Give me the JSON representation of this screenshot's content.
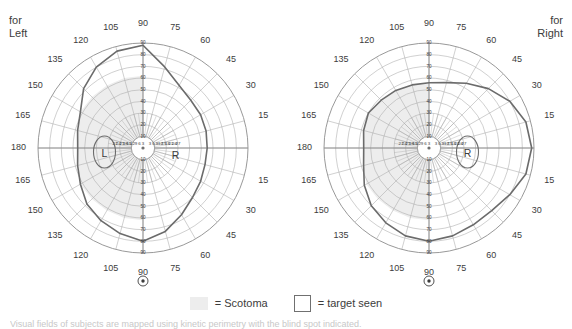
{
  "page": {
    "background": "#ffffff",
    "footnote": "Visual fields of subjects are mapped using kinetic perimetry with the blind spot indicated."
  },
  "colors": {
    "grid": "#8d8d8d",
    "grid_fine": "#a8a8a8",
    "isopter": "#6b6b6b",
    "scotoma_fill": "#ededed",
    "text": "#3c3c3c",
    "white": "#ffffff"
  },
  "legend": {
    "items": [
      {
        "swatch": "filled",
        "label": "= Scotoma"
      },
      {
        "swatch": "outline",
        "label": "= target seen"
      }
    ]
  },
  "charts": [
    {
      "id": "left-eye-field",
      "caption_line1": "for",
      "caption_line2": "Left",
      "caption_position": "left",
      "blind_spot": {
        "label": "L",
        "side": "left",
        "has_outline": true
      },
      "secondary_marker": {
        "label": "R",
        "side": "right",
        "has_outline": false
      },
      "fixation_marker": "⊙",
      "meridian_labels": [
        "15",
        "30",
        "45",
        "60",
        "75",
        "90",
        "105",
        "120",
        "135",
        "150",
        "165",
        "180",
        "165",
        "150",
        "135",
        "120",
        "105",
        "90",
        "75",
        "60",
        "45",
        "30",
        "15"
      ],
      "meridian_left": [
        "15",
        "30",
        "45",
        "60",
        "75",
        "90",
        "105",
        "120",
        "135",
        "150",
        "165"
      ],
      "meridian_right": [
        "15",
        "30",
        "45",
        "60",
        "75",
        "90",
        "105",
        "120",
        "135",
        "150",
        "165"
      ],
      "meridian_bottom": "180",
      "eccentricity_rings": [
        "10",
        "20",
        "30",
        "40",
        "50",
        "60",
        "70",
        "80",
        "90"
      ],
      "horizontal_ticks_left": [
        "27",
        "24",
        "21",
        "18",
        "15",
        "12",
        "9",
        "6",
        "3"
      ],
      "horizontal_ticks_right": [
        "3",
        "6",
        "9",
        "12",
        "15",
        "18",
        "21",
        "24",
        "27"
      ],
      "scotoma_side": "left",
      "description": "Left eye Goldmann field with nasal scotoma region shaded"
    },
    {
      "id": "right-eye-field",
      "caption_line1": "for",
      "caption_line2": "Right",
      "caption_position": "right",
      "blind_spot": {
        "label": "R",
        "side": "right",
        "has_outline": true
      },
      "secondary_marker": {
        "label": "",
        "side": "left",
        "has_outline": false
      },
      "fixation_marker": "⊙",
      "meridian_labels": [
        "15",
        "30",
        "45",
        "60",
        "75",
        "90",
        "105",
        "120",
        "135",
        "150",
        "165",
        "180",
        "165",
        "150",
        "135",
        "120",
        "105",
        "90",
        "75",
        "60",
        "45",
        "30",
        "15"
      ],
      "meridian_left": [
        "15",
        "30",
        "45",
        "60",
        "75",
        "90",
        "105",
        "120",
        "135",
        "150",
        "165"
      ],
      "meridian_right": [
        "15",
        "30",
        "45",
        "60",
        "75",
        "90",
        "105",
        "120",
        "135",
        "150",
        "165"
      ],
      "meridian_bottom": "180",
      "eccentricity_rings": [
        "10",
        "20",
        "30",
        "40",
        "50",
        "60",
        "70",
        "80",
        "90"
      ],
      "horizontal_ticks_left": [
        "27",
        "24",
        "21",
        "18",
        "15",
        "12",
        "9",
        "6",
        "3"
      ],
      "horizontal_ticks_right": [
        "3",
        "6",
        "9",
        "12",
        "15",
        "18",
        "21",
        "24",
        "27"
      ],
      "scotoma_side": "left",
      "description": "Right eye Goldmann field with nasal scotoma region shaded"
    }
  ],
  "chart_data": {
    "type": "line",
    "subtitle": "",
    "xlabel": "",
    "ylabel": "",
    "coordinate_system": "polar",
    "angular_unit": "degrees",
    "radial_unit": "degrees of eccentricity",
    "angular_ticks": [
      0,
      15,
      30,
      45,
      60,
      75,
      90,
      105,
      120,
      135,
      150,
      165,
      180,
      195,
      210,
      225,
      240,
      255,
      270,
      285,
      300,
      315,
      330,
      345
    ],
    "angular_tick_labels": [
      "0",
      "15",
      "30",
      "45",
      "60",
      "75",
      "90",
      "105",
      "120",
      "135",
      "150",
      "165",
      "180",
      "165",
      "150",
      "135",
      "120",
      "105",
      "90",
      "75",
      "60",
      "45",
      "30",
      "15"
    ],
    "radial_ticks": [
      10,
      20,
      30,
      40,
      50,
      60,
      70,
      80,
      90
    ],
    "radial_tick_labels": [
      "10",
      "20",
      "30",
      "40",
      "50",
      "60",
      "70",
      "80",
      "90"
    ],
    "horizontal_meridian_tick_labels": [
      "27",
      "24",
      "21",
      "18",
      "15",
      "12",
      "9",
      "6",
      "3",
      "3",
      "6",
      "9",
      "12",
      "15",
      "18",
      "21",
      "24",
      "27"
    ],
    "rlim": [
      0,
      90
    ],
    "grid": true,
    "legend_position": "bottom-center",
    "series": [
      {
        "name": "Left eye isopter (target seen boundary)",
        "chart": "left-eye-field",
        "closed": true,
        "polar_points": [
          {
            "angle_deg": 0,
            "r": 55
          },
          {
            "angle_deg": 15,
            "r": 56
          },
          {
            "angle_deg": 30,
            "r": 57
          },
          {
            "angle_deg": 45,
            "r": 58
          },
          {
            "angle_deg": 60,
            "r": 62
          },
          {
            "angle_deg": 75,
            "r": 72
          },
          {
            "angle_deg": 90,
            "r": 88
          },
          {
            "angle_deg": 105,
            "r": 86
          },
          {
            "angle_deg": 120,
            "r": 80
          },
          {
            "angle_deg": 135,
            "r": 72
          },
          {
            "angle_deg": 150,
            "r": 62
          },
          {
            "angle_deg": 165,
            "r": 58
          },
          {
            "angle_deg": 180,
            "r": 56
          },
          {
            "angle_deg": 195,
            "r": 58
          },
          {
            "angle_deg": 210,
            "r": 62
          },
          {
            "angle_deg": 225,
            "r": 68
          },
          {
            "angle_deg": 240,
            "r": 72
          },
          {
            "angle_deg": 255,
            "r": 76
          },
          {
            "angle_deg": 270,
            "r": 80
          },
          {
            "angle_deg": 285,
            "r": 74
          },
          {
            "angle_deg": 300,
            "r": 66
          },
          {
            "angle_deg": 315,
            "r": 60
          },
          {
            "angle_deg": 330,
            "r": 57
          },
          {
            "angle_deg": 345,
            "r": 55
          }
        ]
      },
      {
        "name": "Right eye isopter (target seen boundary)",
        "chart": "right-eye-field",
        "closed": true,
        "polar_points": [
          {
            "angle_deg": 0,
            "r": 88
          },
          {
            "angle_deg": 15,
            "r": 86
          },
          {
            "angle_deg": 30,
            "r": 80
          },
          {
            "angle_deg": 45,
            "r": 72
          },
          {
            "angle_deg": 60,
            "r": 64
          },
          {
            "angle_deg": 75,
            "r": 58
          },
          {
            "angle_deg": 90,
            "r": 56
          },
          {
            "angle_deg": 105,
            "r": 56
          },
          {
            "angle_deg": 120,
            "r": 57
          },
          {
            "angle_deg": 135,
            "r": 58
          },
          {
            "angle_deg": 150,
            "r": 60
          },
          {
            "angle_deg": 165,
            "r": 58
          },
          {
            "angle_deg": 180,
            "r": 56
          },
          {
            "angle_deg": 195,
            "r": 58
          },
          {
            "angle_deg": 210,
            "r": 64
          },
          {
            "angle_deg": 225,
            "r": 70
          },
          {
            "angle_deg": 240,
            "r": 74
          },
          {
            "angle_deg": 255,
            "r": 78
          },
          {
            "angle_deg": 270,
            "r": 80
          },
          {
            "angle_deg": 285,
            "r": 78
          },
          {
            "angle_deg": 300,
            "r": 76
          },
          {
            "angle_deg": 315,
            "r": 76
          },
          {
            "angle_deg": 330,
            "r": 80
          },
          {
            "angle_deg": 345,
            "r": 86
          }
        ]
      }
    ],
    "annotations": [
      {
        "chart": "left-eye-field",
        "text": "L",
        "angle_deg": 180,
        "r": 33,
        "type": "blind-spot"
      },
      {
        "chart": "left-eye-field",
        "text": "R",
        "angle_deg": 0,
        "r": 28,
        "type": "marker"
      },
      {
        "chart": "right-eye-field",
        "text": "R",
        "angle_deg": 0,
        "r": 33,
        "type": "blind-spot"
      }
    ]
  }
}
